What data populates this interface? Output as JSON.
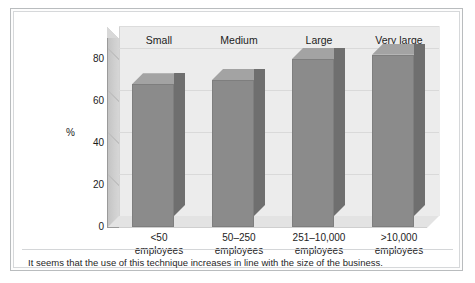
{
  "figure": {
    "caption": "It seems that the use of this technique increases in line with the size of the business."
  },
  "colors": {
    "bar_front": "#8b8b8b",
    "bar_side": "#6f6f6f",
    "bar_top": "#a3a3a3",
    "plot_background": "#ececec",
    "floor": "#e3e3e3",
    "gridline": "#d9d9d9",
    "axis": "#9a9a9a",
    "frame_border": "#b9bcbe",
    "text": "#1c1c1c"
  },
  "chart_data": {
    "type": "bar",
    "title": "",
    "xlabel": "",
    "ylabel": "%",
    "ylim": [
      0,
      90
    ],
    "yticks": [
      0,
      20,
      40,
      60,
      80
    ],
    "ytick_labels": [
      "0",
      "20",
      "40",
      "60",
      "80"
    ],
    "grid": true,
    "legend": "none",
    "three_d": true,
    "categories": [
      "<50\nemployees",
      "50–250\nemployees",
      "251–10,000\nemployees",
      ">10,000\nemployees"
    ],
    "category_lines": [
      [
        "<50",
        "employees"
      ],
      [
        "50–250",
        "employees"
      ],
      [
        "251–10,000",
        "employees"
      ],
      [
        ">10,000",
        "employees"
      ]
    ],
    "column_headers": [
      "Small",
      "Medium",
      "Large",
      "Very large"
    ],
    "values": [
      68,
      70,
      80,
      82
    ],
    "series": [
      {
        "name": "Use of technique",
        "values": [
          68,
          70,
          80,
          82
        ]
      }
    ]
  }
}
